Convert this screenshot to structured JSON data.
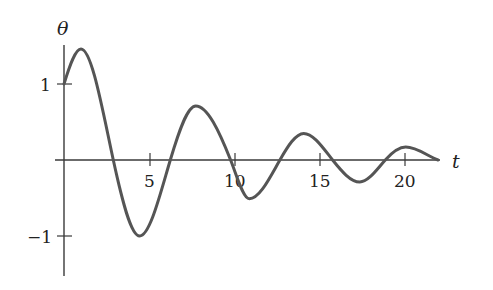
{
  "chart_data": {
    "type": "line",
    "title": "",
    "xlabel": "t",
    "ylabel": "θ",
    "xlim": [
      0,
      22
    ],
    "ylim": [
      -1.45,
      1.8
    ],
    "grid": false,
    "legend": null,
    "x_ticks": [
      5,
      10,
      15,
      20
    ],
    "x_tick_labels": [
      "5",
      "10",
      "15",
      "20"
    ],
    "y_ticks": [
      1,
      -1
    ],
    "y_tick_labels": [
      "1",
      "−1"
    ],
    "series": [
      {
        "name": "θ(t)",
        "description": "damped oscillation",
        "x": [
          0,
          1.0,
          2.9,
          4.45,
          6.25,
          7.75,
          9.8,
          10.9,
          12.7,
          14.1,
          15.8,
          17.4,
          18.9,
          20.1,
          22.0
        ],
        "y": [
          1.0,
          1.46,
          0.0,
          -1.0,
          0.0,
          0.71,
          0.0,
          -0.51,
          0.0,
          0.35,
          0.0,
          -0.29,
          0.0,
          0.17,
          0.0
        ]
      }
    ]
  },
  "labels": {
    "y_axis": "θ",
    "x_axis": "t",
    "xtick_5": "5",
    "xtick_10": "10",
    "xtick_15": "15",
    "xtick_20": "20",
    "ytick_1": "1",
    "ytick_m1": "−1"
  }
}
